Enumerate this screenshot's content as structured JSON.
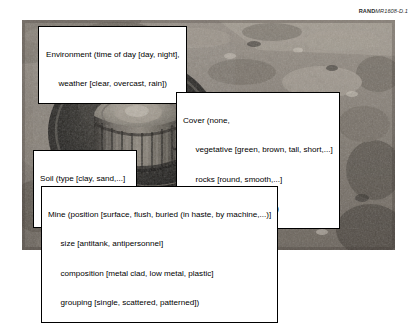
{
  "figure_id": {
    "bold_part": "RAND",
    "italic_part": "MR1608-D.1"
  },
  "photo": {
    "alt": "grayscale photograph of a cylindrical landmine sitting in an excavated pit in rocky soil",
    "subject": "landmine-in-pit"
  },
  "callouts": {
    "environment": {
      "name": "Environment",
      "lines": [
        "Environment (time of day [day, night],",
        "weather [clear, overcast, rain])"
      ]
    },
    "cover": {
      "name": "Cover",
      "lines": [
        "Cover (none,",
        "vegetative [green, brown, tall, short,...]",
        "rocks [round, smooth,...]",
        "water [depth, clarity,...])"
      ]
    },
    "soil": {
      "name": "Soil",
      "lines": [
        "Soil (type [clay, sand,...]",
        "moisture [wet, dry,...])"
      ]
    },
    "mine": {
      "name": "Mine",
      "lines": [
        "Mine (position [surface, flush, buried (in haste, by machine,...)]",
        "size [antitank, antipersonnel]",
        "composition [metal clad, low metal, plastic]",
        "grouping [single, scattered, patterned])"
      ]
    }
  }
}
